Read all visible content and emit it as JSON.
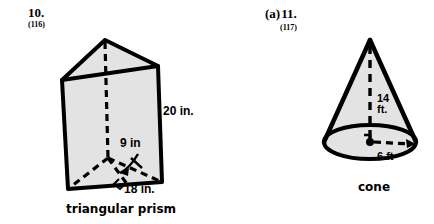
{
  "problems": [
    {
      "number": "10.",
      "prefix": "",
      "reference": "(116)",
      "shape_caption": "triangular prism",
      "labels": {
        "height": "20 in.",
        "triangle_height": "9 in",
        "base": "18 in."
      }
    },
    {
      "number": "11.",
      "prefix": "(a)",
      "reference": "(117)",
      "shape_caption": "cone",
      "labels": {
        "height_line1": "14",
        "height_line2": "ft.",
        "radius": "6 ft"
      }
    }
  ],
  "colors": {
    "ink": "#000000",
    "shape_fill": "#e3e3e3",
    "page_background": "#ffffff"
  }
}
